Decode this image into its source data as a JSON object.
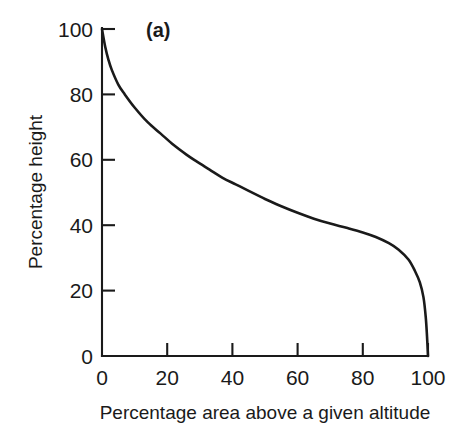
{
  "chart_data": {
    "type": "line",
    "title": "",
    "panel_label": "(a)",
    "xlabel": "Percentage area above a given altitude",
    "ylabel": "Percentage height",
    "xlim": [
      0,
      100
    ],
    "ylim": [
      0,
      100
    ],
    "xticks": [
      0,
      20,
      40,
      60,
      80,
      100
    ],
    "yticks": [
      0,
      20,
      40,
      60,
      80,
      100
    ],
    "xtick_labels": [
      "0",
      "20",
      "40",
      "60",
      "80",
      "100"
    ],
    "ytick_labels": [
      "0",
      "20",
      "40",
      "60",
      "80",
      "100"
    ],
    "grid": false,
    "legend": "none",
    "series": [
      {
        "name": "Hypsometric curve",
        "color": "#1a1a1a",
        "x": [
          0,
          1,
          2,
          3,
          5,
          7,
          10,
          14,
          18,
          22,
          26,
          29,
          33,
          37,
          41,
          45,
          50,
          55,
          60,
          65,
          70,
          75,
          80,
          84,
          88,
          91,
          94,
          96,
          97.5,
          98.6,
          99.3,
          99.7,
          100
        ],
        "y": [
          100,
          94.5,
          90.5,
          87.5,
          83,
          80,
          76,
          71.5,
          68,
          64.5,
          61.5,
          59.5,
          57,
          54.5,
          52.5,
          50.5,
          48,
          45.8,
          43.8,
          42,
          40.5,
          39.2,
          37.8,
          36.4,
          34.5,
          32.5,
          29.5,
          26,
          22.5,
          18,
          12,
          6,
          0
        ]
      }
    ],
    "tick_readings": [
      {
        "percentage_height": 100,
        "percentage_area": 0
      },
      {
        "percentage_height": 80,
        "percentage_area": 7
      },
      {
        "percentage_height": 60,
        "percentage_area": 28.5
      },
      {
        "percentage_height": 40,
        "percentage_area": 61
      },
      {
        "percentage_height": 20,
        "percentage_area": 96
      },
      {
        "percentage_height": 0,
        "percentage_area": 100
      }
    ]
  }
}
